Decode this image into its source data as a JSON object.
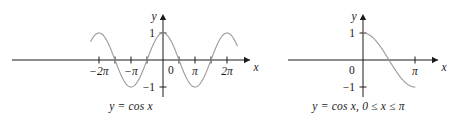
{
  "figure": {
    "background_color": "#ffffff",
    "curve_color": "#9a9a9a",
    "axis_color": "#1a1a1a",
    "text_color": "#1a1a1a"
  },
  "chart_data": [
    {
      "type": "line",
      "panel": "left",
      "title": "",
      "caption": "y = cos x",
      "function": "cos",
      "xlabel": "x",
      "ylabel": "y",
      "xlim": [
        -7.2,
        7.6
      ],
      "ylim": [
        -1.45,
        1.45
      ],
      "grid": false,
      "legend": null,
      "x_tick_labels": [
        "−2π",
        "−π",
        "π",
        "2π"
      ],
      "x_tick_values": [
        -6.283185,
        -3.141593,
        3.141593,
        6.283185
      ],
      "x_minor_tick_values": [
        -4.712389,
        -1.570796,
        1.570796,
        4.712389
      ],
      "y_tick_labels": [
        "1",
        "−1"
      ],
      "y_tick_values": [
        1,
        -1
      ],
      "origin_label": "0",
      "x_domain": [
        -7.1,
        7.3
      ],
      "samples": 400
    },
    {
      "type": "line",
      "panel": "right",
      "title": "",
      "caption": "y = cos x, 0 ≤ x ≤ π",
      "function": "cos",
      "xlabel": "x",
      "ylabel": "y",
      "xlim": [
        -0.9,
        4.3
      ],
      "ylim": [
        -1.45,
        1.45
      ],
      "grid": false,
      "legend": null,
      "x_tick_labels": [
        "π"
      ],
      "x_tick_values": [
        3.141593
      ],
      "y_tick_labels": [
        "1",
        "−1"
      ],
      "y_tick_values": [
        1,
        -1
      ],
      "origin_label": "0",
      "x_domain": [
        0,
        3.141593
      ],
      "samples": 200
    }
  ]
}
